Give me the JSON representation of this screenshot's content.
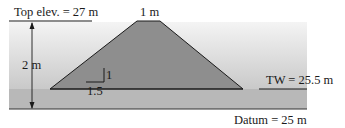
{
  "diagram": {
    "labels": {
      "top_elevation": "Top elev. = 27 m",
      "crest_width": "1 m",
      "height": "2 m",
      "slope_rise": "1",
      "slope_run": "1.5",
      "tailwater": "TW = 25.5 m",
      "datum": "Datum = 25 m"
    },
    "values": {
      "top_elevation_m": 27,
      "crest_width_m": 1,
      "dam_height_m": 2,
      "side_slope_h_to_v": "1.5:1",
      "tailwater_elevation_m": 25.5,
      "datum_elevation_m": 25
    },
    "colors": {
      "dam_fill": "#8f8f8f",
      "water_fill": "#b4b4b4",
      "background_gradient_top": "#f2f2f2",
      "background_gradient_bottom": "#c8c8c8",
      "line": "#1a1a1a"
    }
  }
}
